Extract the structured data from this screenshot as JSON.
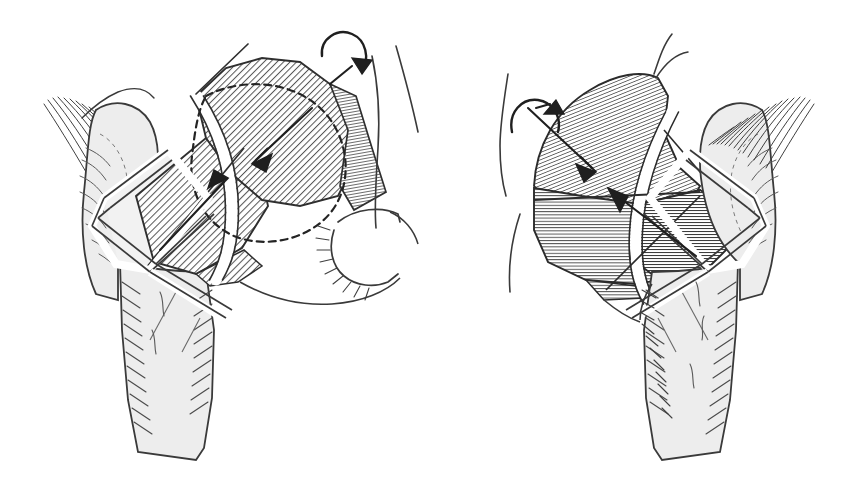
{
  "figure": {
    "kind": "anatomical-line-illustration",
    "width": 858,
    "height": 494,
    "background_color": "#ffffff",
    "caption": "",
    "title": "",
    "labels": [],
    "annotations": []
  },
  "style": {
    "ink": "#2b2b2b",
    "ink_soft": "#4a4a4a",
    "bone_fill": "#ededed",
    "bone_fill_light": "#f2f2f2",
    "hatch_light": "#8a8a8a",
    "hatch_dark": "#5c5c5c",
    "white": "#ffffff",
    "stroke_outline": 2.1,
    "stroke_thin": 1.1,
    "stroke_hair": 0.75,
    "dash_pattern": "7 5"
  },
  "panels": [
    {
      "id": "left-panel",
      "name": "left-hip-view",
      "side": "left",
      "rotation_arrow": {
        "name": "rotation-arrow-clockwise",
        "direction": "clockwise",
        "position": "superior"
      },
      "regions": [
        {
          "name": "femoral-head-proximal-fragment",
          "hatch": "diagonal-light",
          "angle_deg": 45
        },
        {
          "name": "femoral-head-distal-fragment",
          "hatch": "diagonal-light",
          "angle_deg": 45
        },
        {
          "name": "femoral-neck-wedge",
          "hatch": "none",
          "fill": "bone"
        },
        {
          "name": "greater-trochanter",
          "hatch": "trabecular",
          "fill": "bone"
        },
        {
          "name": "femoral-shaft",
          "hatch": "trabecular-edge",
          "fill": "bone"
        },
        {
          "name": "acetabular-fossa-notch",
          "hatch": "radiating",
          "fill": "bone"
        }
      ],
      "osteotomy_band": {
        "name": "osteotomy-gap-band",
        "color": "#ffffff"
      },
      "hidden_contour": {
        "name": "femoral-head-dashed-outline",
        "style": "dashed"
      },
      "direction_arrows": [
        {
          "name": "correction-arrow-upper",
          "points": "medial"
        },
        {
          "name": "correction-arrow-lower",
          "points": "lateral"
        }
      ]
    },
    {
      "id": "right-panel",
      "name": "right-hip-view",
      "side": "right",
      "rotation_arrow": {
        "name": "rotation-arrow-counterclockwise",
        "direction": "counterclockwise",
        "position": "superior"
      },
      "regions": [
        {
          "name": "femoral-head-proximal-fragment",
          "hatch": "diagonal-fine",
          "angle_deg": 70
        },
        {
          "name": "femoral-head-inferior-fragment",
          "hatch": "horizontal-dense",
          "angle_deg": 0
        },
        {
          "name": "femoral-neck-fragment",
          "hatch": "horizontal-dense",
          "angle_deg": 0
        },
        {
          "name": "greater-trochanter",
          "hatch": "trabecular",
          "fill": "bone"
        },
        {
          "name": "femoral-shaft",
          "hatch": "trabecular-edge",
          "fill": "bone"
        }
      ],
      "osteotomy_band": {
        "name": "osteotomy-gap-band",
        "color": "#ffffff"
      },
      "direction_arrows": [
        {
          "name": "correction-arrow-upper",
          "points": "medial"
        },
        {
          "name": "correction-arrow-lower",
          "points": "lateral"
        }
      ]
    }
  ]
}
